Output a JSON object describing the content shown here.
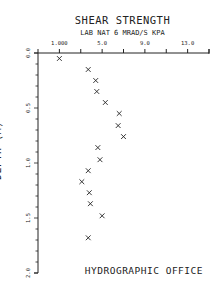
{
  "chart_data": {
    "type": "scatter",
    "title": "SHEAR STRENGTH",
    "subtitle": "LAB NAT 6 MRAD/S KPA",
    "xlabel": "LAB NAT 6 MRAD/S KPA",
    "ylabel": "DEPTH (M)",
    "x_tick_labels": [
      "1.000",
      "5.0",
      "9.0",
      "13.0"
    ],
    "x_ticks": [
      1.0,
      5.0,
      9.0,
      13.0
    ],
    "xlim": [
      -1.0,
      15.0
    ],
    "y_tick_labels": [
      "0.0",
      "0.5",
      "1.0",
      "1.5",
      "2.0"
    ],
    "y_ticks": [
      0.0,
      0.5,
      1.0,
      1.5,
      2.0
    ],
    "ylim": [
      0.0,
      2.0
    ],
    "y_inverted": true,
    "x_axis_position": "top",
    "marker": "x",
    "grid": false,
    "series": [
      {
        "name": "Shear strength",
        "points": [
          {
            "x": 1.0,
            "y": 0.05
          },
          {
            "x": 3.7,
            "y": 0.15
          },
          {
            "x": 4.4,
            "y": 0.25
          },
          {
            "x": 4.5,
            "y": 0.35
          },
          {
            "x": 5.3,
            "y": 0.45
          },
          {
            "x": 6.6,
            "y": 0.55
          },
          {
            "x": 6.5,
            "y": 0.66
          },
          {
            "x": 7.0,
            "y": 0.76
          },
          {
            "x": 4.6,
            "y": 0.86
          },
          {
            "x": 4.8,
            "y": 0.97
          },
          {
            "x": 3.7,
            "y": 1.07
          },
          {
            "x": 3.1,
            "y": 1.17
          },
          {
            "x": 3.8,
            "y": 1.27
          },
          {
            "x": 3.9,
            "y": 1.37
          },
          {
            "x": 5.0,
            "y": 1.48
          },
          {
            "x": 3.7,
            "y": 1.68
          }
        ]
      }
    ],
    "annotations": [
      "HYDROGRAPHIC OFFICE"
    ]
  },
  "labels": {
    "title": "SHEAR STRENGTH",
    "subtitle": "LAB NAT 6 MRAD/S KPA",
    "ylabel": "DEPTH (M)",
    "footer": "HYDROGRAPHIC OFFICE"
  },
  "colors": {
    "ink": "#222222",
    "background": "#ffffff"
  }
}
